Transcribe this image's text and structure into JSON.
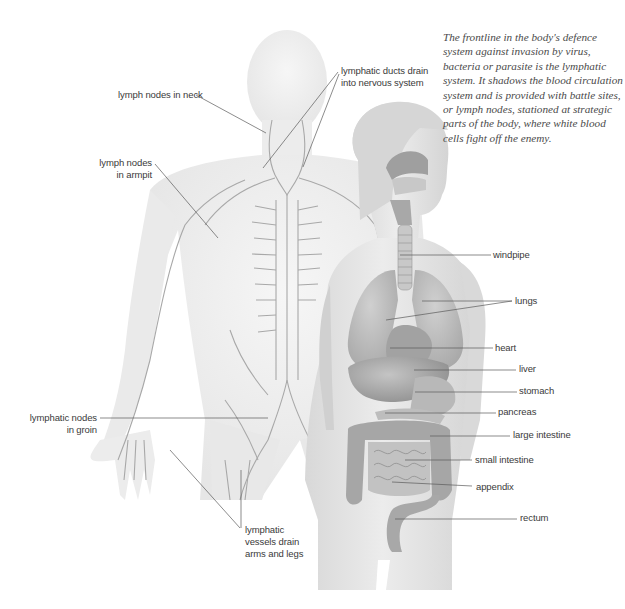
{
  "intro_text": "The frontline in the body's defence system against invasion by virus, bacteria or parasite is the lymphatic system. It shadows the blood circulation system and is provided with battle sites, or lymph nodes, stationed at strategic parts of the body, where white blood cells fight off the enemy.",
  "figures": {
    "back": {
      "name": "lymphatic-system-figure",
      "labels": {
        "neck": "lymph nodes in neck",
        "ducts_l1": "lymphatic ducts drain",
        "ducts_l2": "into nervous system",
        "armpit_l1": "lymph nodes",
        "armpit_l2": "in armpit",
        "groin_l1": "lymphatic nodes",
        "groin_l2": "in groin",
        "vessels_l1": "lymphatic",
        "vessels_l2": "vessels drain",
        "vessels_l3": "arms and legs"
      }
    },
    "front": {
      "name": "internal-organs-figure",
      "labels": {
        "windpipe": "windpipe",
        "lungs": "lungs",
        "heart": "heart",
        "liver": "liver",
        "stomach": "stomach",
        "pancreas": "pancreas",
        "large_intestine": "large intestine",
        "small_intestine": "small intestine",
        "appendix": "appendix",
        "rectum": "rectum"
      }
    }
  },
  "colors": {
    "skin_back": "#eeeeee",
    "skin_front": "#e2e2e2",
    "vessel": "#a8a8a8",
    "organ_dark": "#9a9a9a",
    "organ_mid": "#b5b5b5",
    "leader_line": "#555555",
    "label_text": "#3a3a3a"
  }
}
